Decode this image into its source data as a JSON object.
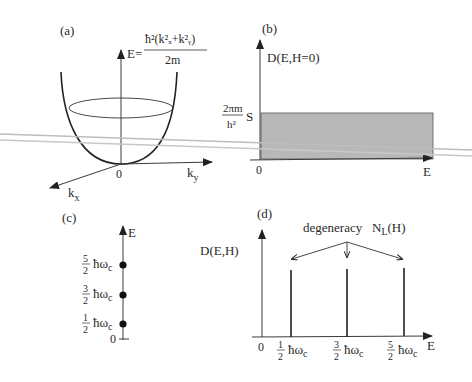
{
  "panels": {
    "a": {
      "label": "(a)",
      "formula_lhs": "E=",
      "formula_num": "ħ²(k²ₓ+k²ᵧ)",
      "formula_den": "2m",
      "origin": "0",
      "axis_x": "k",
      "axis_x_sub": "x",
      "axis_y": "k",
      "axis_y_sub": "y"
    },
    "b": {
      "label": "(b)",
      "ylabel": "D(E,H=0)",
      "level_num": "2πm",
      "level_den": "h²",
      "level_suffix": "S",
      "origin": "0",
      "xlabel": "E",
      "fill_color": "#b8b8b8"
    },
    "c": {
      "label": "(c)",
      "ylabel": "E",
      "origin": "0",
      "levels": [
        {
          "num": "5",
          "den": "2",
          "unit": "ħω",
          "sub": "c"
        },
        {
          "num": "3",
          "den": "2",
          "unit": "ħω",
          "sub": "c"
        },
        {
          "num": "1",
          "den": "2",
          "unit": "ħω",
          "sub": "c"
        }
      ]
    },
    "d": {
      "label": "(d)",
      "ylabel": "D(E,H)",
      "annotation": "degeneracy",
      "annotation_sym": "N",
      "annotation_sub": "L",
      "annotation_arg": "(H)",
      "origin": "0",
      "xlabel": "E",
      "ticks": [
        {
          "num": "1",
          "den": "2",
          "unit": "ħω",
          "sub": "c"
        },
        {
          "num": "3",
          "den": "2",
          "unit": "ħω",
          "sub": "c"
        },
        {
          "num": "5",
          "den": "2",
          "unit": "ħω",
          "sub": "c"
        }
      ]
    }
  },
  "overlay": {
    "stray_lines_color": "#bdbdbd"
  }
}
